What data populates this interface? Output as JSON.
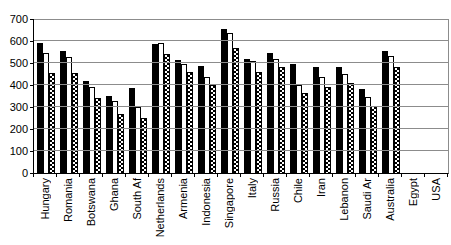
{
  "chart_data": {
    "type": "bar",
    "title": "",
    "xlabel": "",
    "ylabel": "",
    "ylim": [
      0,
      700
    ],
    "y_ticks": [
      0,
      100,
      200,
      300,
      400,
      500,
      600,
      700
    ],
    "grid": true,
    "legend": "none",
    "categories": [
      "Hungary",
      "Romania",
      "Botswana",
      "Ghana",
      "South Af",
      "Netherlands",
      "Armenia",
      "Indonesia",
      "Singapore",
      "Italy",
      "Russia",
      "Chile",
      "Iran",
      "Lebanon",
      "Saudi Ar",
      "Australia",
      "Egypt",
      "USA"
    ],
    "series": [
      {
        "name": "series-1",
        "style": "solid",
        "fill": "#000000",
        "values": [
          590,
          555,
          420,
          350,
          385,
          585,
          515,
          485,
          655,
          520,
          545,
          495,
          480,
          480,
          380,
          555,
          null,
          null
        ]
      },
      {
        "name": "series-2",
        "style": "outline",
        "fill": "#ffffff",
        "values": [
          545,
          525,
          390,
          325,
          300,
          590,
          495,
          435,
          635,
          510,
          520,
          400,
          435,
          450,
          345,
          530,
          null,
          null
        ]
      },
      {
        "name": "series-3",
        "style": "checker",
        "fill": "checkerboard-black-white",
        "values": [
          455,
          455,
          340,
          268,
          250,
          540,
          460,
          400,
          570,
          460,
          480,
          365,
          390,
          410,
          305,
          480,
          null,
          null
        ]
      }
    ],
    "colors": {
      "background": "#ffffff",
      "text": "#000000",
      "gridline": "#8c8c8c",
      "axis": "#000000"
    }
  }
}
